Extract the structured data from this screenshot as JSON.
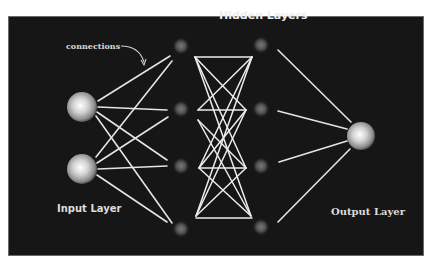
{
  "diagram": {
    "title": "Hidden Layers",
    "annotation": "connections",
    "labels": {
      "input": "Input Layer",
      "output": "Output Layer",
      "hidden": "Hidden Layers"
    },
    "colors": {
      "background": "#161616",
      "line": "#e8e8e8",
      "node_bright": "#f2f2f2",
      "node_dim": "#5a5a5a",
      "text": "#e6e6e6"
    },
    "layers": [
      {
        "name": "input",
        "nodes": 2
      },
      {
        "name": "hidden-1",
        "nodes": 4
      },
      {
        "name": "hidden-2",
        "nodes": 4
      },
      {
        "name": "output",
        "nodes": 1
      }
    ]
  }
}
